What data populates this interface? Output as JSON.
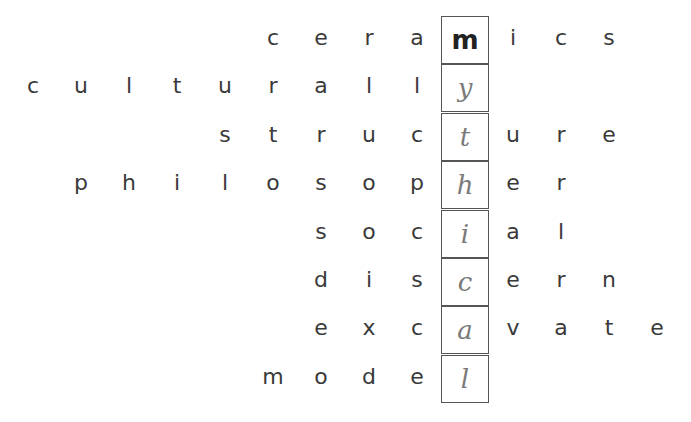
{
  "puzzle": {
    "hidden_word": "mythical",
    "rows": [
      {
        "word": "ceramics",
        "before": "cera",
        "key": "m",
        "after": "ics",
        "key_printed": true
      },
      {
        "word": "culturally",
        "before": "culturall",
        "key": "y",
        "after": "",
        "key_printed": false
      },
      {
        "word": "structure",
        "before": "struc",
        "key": "t",
        "after": "ure",
        "key_printed": false
      },
      {
        "word": "philosopher",
        "before": "philosop",
        "key": "h",
        "after": "er",
        "key_printed": false
      },
      {
        "word": "social",
        "before": "soc",
        "key": "i",
        "after": "al",
        "key_printed": false
      },
      {
        "word": "discern",
        "before": "dis",
        "key": "c",
        "after": "ern",
        "key_printed": false
      },
      {
        "word": "excavate",
        "before": "exc",
        "key": "a",
        "after": "vate",
        "key_printed": false
      },
      {
        "word": "model",
        "before": "mode",
        "key": "l",
        "after": "",
        "key_printed": false
      }
    ]
  }
}
